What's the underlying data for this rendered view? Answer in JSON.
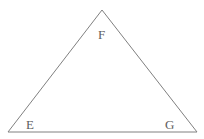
{
  "figure": {
    "kind": "geometry-diagram",
    "shape_name": "triangle",
    "background_color": "#ffffff",
    "stroke_color": "#808080",
    "stroke_width": 1,
    "label_color": "#5e5e5e",
    "canvas": {
      "width": 204,
      "height": 139
    },
    "vertices": [
      {
        "id": "F",
        "label": "F",
        "x": 102,
        "y": 10,
        "label_x": 98,
        "label_y": 28
      },
      {
        "id": "E",
        "label": "E",
        "x": 8,
        "y": 132,
        "label_x": 26,
        "label_y": 118
      },
      {
        "id": "G",
        "label": "G",
        "x": 197,
        "y": 132,
        "label_x": 165,
        "label_y": 118
      }
    ],
    "edges": [
      {
        "id": "EF",
        "from": "E",
        "to": "F"
      },
      {
        "id": "FG",
        "from": "F",
        "to": "G"
      },
      {
        "id": "EG",
        "from": "E",
        "to": "G"
      }
    ]
  }
}
